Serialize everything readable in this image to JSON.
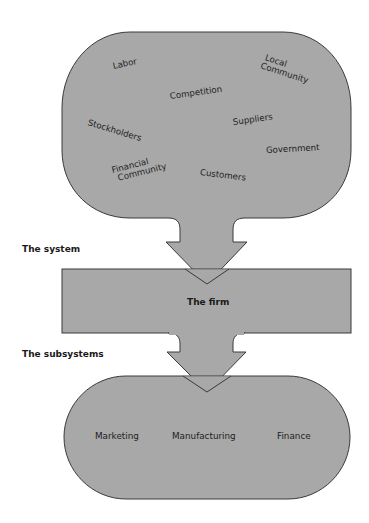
{
  "diagram": {
    "fill_color": "#a8a8a8",
    "stroke_color": "#3a3a3a",
    "environment": {
      "items": [
        {
          "label": "Labor"
        },
        {
          "label": "Local\nCommunity",
          "line1": "Local",
          "line2": "Community"
        },
        {
          "label": "Competition"
        },
        {
          "label": "Stockholders"
        },
        {
          "label": "Suppliers"
        },
        {
          "label": "Government"
        },
        {
          "label": "Financial\nCommunity",
          "line1": "Financial",
          "line2": "Community"
        },
        {
          "label": "Customers"
        }
      ]
    },
    "labels": {
      "system": "The system",
      "subsystems": "The subsystems"
    },
    "firm": {
      "label": "The firm"
    },
    "subsystems": {
      "items": [
        {
          "label": "Marketing"
        },
        {
          "label": "Manufacturing"
        },
        {
          "label": "Finance"
        }
      ]
    }
  }
}
